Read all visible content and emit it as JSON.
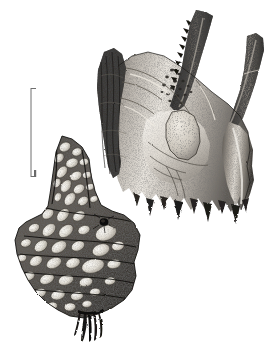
{
  "figure": {
    "kind": "scientific-illustration",
    "technique": "pen-and-ink stipple drawing",
    "background_color": "#ffffff",
    "ink_color": "#1a1a1a",
    "mid_tone_color": "#8c8c8c",
    "highlight_color": "#f2f0ec"
  },
  "scale_bar": {
    "name": "scale-bar",
    "orientation": "vertical",
    "label": "",
    "tick_label_bottom": "",
    "x": 31,
    "y_top": 88,
    "y_bottom": 177,
    "length_px": 89,
    "color": "#6e6e6e",
    "tick_direction": "right",
    "tick_length_px": 5
  },
  "specimens": [
    {
      "id": "specimen-upper-right",
      "name": "upper-right-bone-specimen",
      "description": "Y-shaped fossil bone fragment with two ascending processes, the left one serrated and dark, the right one a smooth tapering horn; broad eroded basal plate with drip-like broken lower margin and a rough granular knob in the central fossa.",
      "bounding_box": {
        "x": 96,
        "y": 8,
        "width": 170,
        "height": 218
      },
      "features": [
        "serrated-left-process",
        "smooth-right-process",
        "central-granular-knob",
        "splintered-left-margin",
        "eroded-basal-margin",
        "pitted-foramina-field"
      ]
    },
    {
      "id": "specimen-lower-left",
      "name": "lower-left-tuberculate-specimen",
      "description": "Elongate tuberculate dermal plate or jaw fragment covered with pale ovoid tubercles set in a dark stippled matrix; narrow above, flaring to a broad trapezoidal base with a small frayed root-like projection at the bottom and a small dark perforation on the right flank.",
      "bounding_box": {
        "x": 14,
        "y": 135,
        "width": 127,
        "height": 200
      },
      "features": [
        "pale-ovoid-tubercles",
        "dark-stippled-matrix",
        "flaring-basal-plate",
        "frayed-basal-root",
        "dark-perforation"
      ]
    }
  ],
  "labels": {
    "plate_number": "",
    "caption": "",
    "figure_letters": []
  }
}
